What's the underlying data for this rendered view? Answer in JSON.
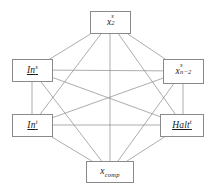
{
  "diagram": {
    "type": "graph",
    "graph_kind": "complete-graph",
    "node_count": 6,
    "edge_count": 15,
    "canvas": {
      "width": 214,
      "height": 196
    },
    "style": {
      "background_color": "#ffffff",
      "edge_color": "#8a8a8a",
      "edge_width": 0.7,
      "node_border_color": "#8a8a8a",
      "node_fill_color": "#ffffff",
      "label_color": "#1a1a1a"
    },
    "nodes": [
      {
        "id": "x2s",
        "position": "top",
        "cx": 110,
        "cy": 22,
        "x": 90,
        "y": 11,
        "w": 41,
        "h": 23,
        "label_plain": "x^s_2",
        "base": "x",
        "superscript": "s",
        "subscript": "2",
        "underlined": false
      },
      {
        "id": "in_s",
        "position": "upper-left",
        "cx": 32,
        "cy": 70,
        "x": 12,
        "y": 59,
        "w": 41,
        "h": 23,
        "label_plain": "In^s",
        "base": "In",
        "superscript": "s",
        "subscript": "",
        "underlined": true
      },
      {
        "id": "xn2s",
        "position": "upper-right",
        "cx": 183,
        "cy": 71,
        "x": 163,
        "y": 59,
        "w": 41,
        "h": 25,
        "label_plain": "x^s_{n-2}",
        "base": "x",
        "superscript": "s",
        "subscript": "n−2",
        "underlined": false
      },
      {
        "id": "in_t",
        "position": "lower-left",
        "cx": 32,
        "cy": 125,
        "x": 12,
        "y": 114,
        "w": 41,
        "h": 23,
        "label_plain": "In^t",
        "base": "In",
        "superscript": "t",
        "subscript": "",
        "underlined": true
      },
      {
        "id": "halt_t",
        "position": "lower-right",
        "cx": 183,
        "cy": 125,
        "x": 160,
        "y": 114,
        "w": 44,
        "h": 23,
        "label_plain": "Halt^t",
        "base": "Halt",
        "superscript": "t",
        "subscript": "",
        "underlined": true
      },
      {
        "id": "xcomp",
        "position": "bottom",
        "cx": 110,
        "cy": 172,
        "x": 86,
        "y": 161,
        "w": 48,
        "h": 22,
        "label_plain": "x_comp",
        "base": "x",
        "superscript": "",
        "subscript": "comp",
        "underlined": false
      }
    ],
    "edges": [
      {
        "from": "x2s",
        "to": "in_s"
      },
      {
        "from": "x2s",
        "to": "xn2s"
      },
      {
        "from": "x2s",
        "to": "in_t"
      },
      {
        "from": "x2s",
        "to": "halt_t"
      },
      {
        "from": "x2s",
        "to": "xcomp"
      },
      {
        "from": "in_s",
        "to": "xn2s"
      },
      {
        "from": "in_s",
        "to": "in_t"
      },
      {
        "from": "in_s",
        "to": "halt_t"
      },
      {
        "from": "in_s",
        "to": "xcomp"
      },
      {
        "from": "xn2s",
        "to": "in_t"
      },
      {
        "from": "xn2s",
        "to": "halt_t"
      },
      {
        "from": "xn2s",
        "to": "xcomp"
      },
      {
        "from": "in_t",
        "to": "halt_t"
      },
      {
        "from": "in_t",
        "to": "xcomp"
      },
      {
        "from": "halt_t",
        "to": "xcomp"
      }
    ]
  }
}
